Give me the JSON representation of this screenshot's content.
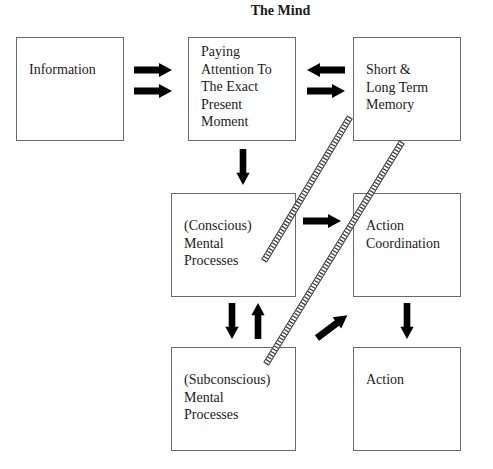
{
  "diagram": {
    "title": "The Mind",
    "nodes": [
      {
        "id": "information",
        "label": "Information"
      },
      {
        "id": "paying-attention",
        "label": "Paying\nAttention To\nThe Exact\nPresent\nMoment"
      },
      {
        "id": "memory",
        "label": "Short &\nLong Term\nMemory"
      },
      {
        "id": "conscious",
        "label": "(Conscious)\nMental\nProcesses"
      },
      {
        "id": "action-coordination",
        "label": "Action\nCoordination"
      },
      {
        "id": "subconscious",
        "label": "(Subconscious)\nMental\nProcesses"
      },
      {
        "id": "action",
        "label": "Action"
      }
    ],
    "edges": [
      {
        "from": "information",
        "to": "paying-attention",
        "style": "double-arrow"
      },
      {
        "from": "memory",
        "to": "paying-attention",
        "style": "arrow"
      },
      {
        "from": "paying-attention",
        "to": "memory",
        "style": "arrow"
      },
      {
        "from": "paying-attention",
        "to": "conscious",
        "style": "arrow"
      },
      {
        "from": "conscious",
        "to": "action-coordination",
        "style": "arrow"
      },
      {
        "from": "conscious",
        "to": "subconscious",
        "style": "arrow"
      },
      {
        "from": "subconscious",
        "to": "conscious",
        "style": "arrow"
      },
      {
        "from": "subconscious",
        "to": "action-coordination",
        "style": "arrow"
      },
      {
        "from": "action-coordination",
        "to": "action",
        "style": "arrow"
      },
      {
        "from": "conscious",
        "to": "memory",
        "style": "ladder"
      },
      {
        "from": "subconscious",
        "to": "memory",
        "style": "ladder"
      }
    ]
  }
}
